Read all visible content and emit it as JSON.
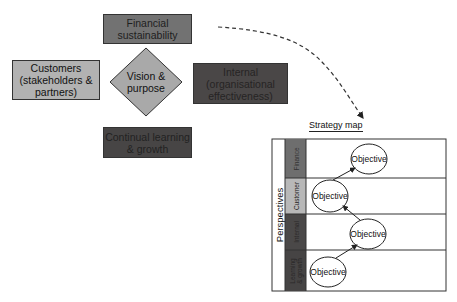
{
  "left_diagram": {
    "center": {
      "label": "Vision & purpose",
      "line1": "Vision &",
      "line2": "purpose",
      "fill": "#a9a9a9"
    },
    "boxes": [
      {
        "id": "financial",
        "line1": "Financial",
        "line2": "sustainability",
        "fill": "#727272"
      },
      {
        "id": "customers",
        "line1": "Customers",
        "line2": "(stakeholders &",
        "line3": "partners)",
        "fill": "#b2b2b2"
      },
      {
        "id": "internal",
        "line1": "Internal",
        "line2": "(organisational",
        "line3": "effectiveness)",
        "fill": "#4a4747"
      },
      {
        "id": "learning",
        "line1": "Continual learning",
        "line2": "& growth",
        "fill": "#474545"
      }
    ]
  },
  "connector": {
    "style": "dashed",
    "direction": "to strategy map"
  },
  "strategy_map": {
    "title": "Strategy map",
    "axis_label": "Perspectives",
    "rows": [
      {
        "label": "Finance",
        "fill": "#6e6e6e",
        "objective": "Objective"
      },
      {
        "label": "Customer",
        "fill": "#b8b8b8",
        "objective": "Objective"
      },
      {
        "label": "Internal",
        "fill": "#4a4848",
        "objective": "Objective"
      },
      {
        "label_line1": "Learning",
        "label_line2": "& growth",
        "fill": "#464444",
        "objective": "Objective"
      }
    ]
  }
}
